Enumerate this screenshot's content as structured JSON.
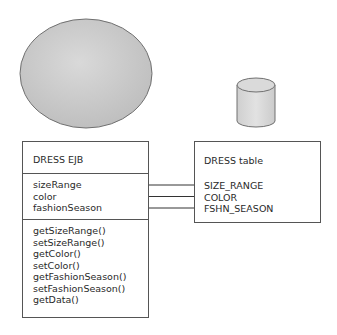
{
  "diagram": {
    "entity_shape": {
      "shape": "ellipse",
      "fill": "#c8c8c8",
      "stroke": "#707070"
    },
    "database_shape": {
      "shape": "cylinder",
      "fill": "#d6d6d6",
      "stroke": "#707070"
    },
    "ejb_box": {
      "title": "DRESS EJB",
      "attributes": [
        "sizeRange",
        "color",
        "fashionSeason"
      ],
      "methods": [
        "getSizeRange()",
        "setSizeRange()",
        "getColor()",
        "setColor()",
        "getFashionSeason()",
        "setFashionSeason()",
        "getData()"
      ]
    },
    "table_box": {
      "title": "DRESS table",
      "columns": [
        "SIZE_RANGE",
        "COLOR",
        "FSHN_SEASON"
      ]
    },
    "mappings": [
      {
        "from": "sizeRange",
        "to": "SIZE_RANGE"
      },
      {
        "from": "color",
        "to": "COLOR"
      },
      {
        "from": "fashionSeason",
        "to": "FSHN_SEASON"
      }
    ],
    "line_color": "#333333"
  }
}
